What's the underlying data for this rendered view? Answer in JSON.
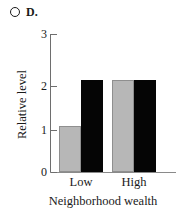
{
  "panel": {
    "marker_icon": "radio-circle-unselected",
    "label": "D."
  },
  "chart_data": {
    "type": "bar",
    "title": "D.",
    "xlabel": "Neighborhood wealth",
    "ylabel": "Relative level",
    "categories": [
      "Low",
      "High"
    ],
    "series": [
      {
        "name": "gray",
        "color": "#b7b7b7",
        "values": [
          1,
          2
        ]
      },
      {
        "name": "black",
        "color": "#050505",
        "values": [
          2,
          2
        ]
      }
    ],
    "ylim": [
      0,
      3
    ],
    "ytick_labels": [
      "0",
      "1",
      "2",
      "3"
    ],
    "ytick_values": [
      0,
      1,
      2,
      3
    ],
    "grid": false,
    "legend": "none"
  },
  "axes": {
    "y_title": "Relative level",
    "x_title": "Neighborhood wealth",
    "y_ticks": [
      {
        "label": "3"
      },
      {
        "label": "2"
      },
      {
        "label": "1"
      },
      {
        "label": "0"
      }
    ],
    "x_categories": [
      {
        "label": "Low"
      },
      {
        "label": "High"
      }
    ]
  }
}
